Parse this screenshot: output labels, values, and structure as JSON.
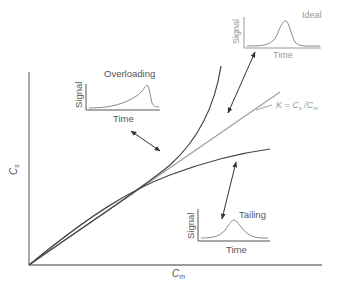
{
  "diagram": {
    "axes": {
      "x_label_main": "C",
      "x_label_sub": "m",
      "y_label_main": "C",
      "y_label_sub": "s"
    },
    "line_label": {
      "prefix": "K = C",
      "sub1": "s",
      "mid": " /C",
      "sub2": "m"
    },
    "insets": {
      "ideal": {
        "title": "Ideal",
        "xlabel": "Time",
        "ylabel": "Signal"
      },
      "overloading": {
        "title": "Overloading",
        "xlabel": "Time",
        "ylabel": "Signal"
      },
      "tailing": {
        "title": "Tailing",
        "xlabel": "Time",
        "ylabel": "Signal"
      }
    },
    "colors": {
      "axis": "#7a7a7a",
      "curve_dark": "#444444",
      "line_light": "#9a9a9a",
      "inset_peak": "#8a8a8a"
    }
  }
}
